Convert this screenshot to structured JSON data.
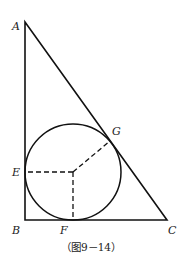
{
  "figure": {
    "caption": "（图9－14）",
    "points": {
      "A": {
        "label": "A",
        "x": 25,
        "y": 22
      },
      "B": {
        "label": "B",
        "x": 25,
        "y": 220
      },
      "C": {
        "label": "C",
        "x": 167,
        "y": 220
      },
      "E": {
        "label": "E",
        "x": 25,
        "y": 172
      },
      "F": {
        "label": "F",
        "x": 73,
        "y": 220
      },
      "G": {
        "label": "G",
        "x": 110,
        "y": 140
      }
    },
    "incircle": {
      "cx": 73,
      "cy": 172,
      "r": 48
    },
    "colors": {
      "stroke": "#111111",
      "background": "#ffffff"
    }
  }
}
